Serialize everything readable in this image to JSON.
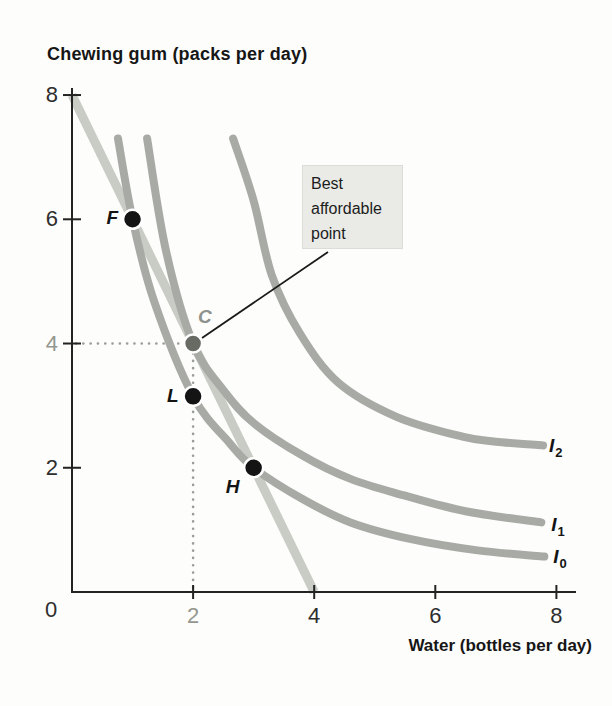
{
  "chart_data": {
    "type": "line",
    "title": "Chewing gum (packs per day)",
    "xlabel": "Water (bottles per day)",
    "x_axis": {
      "range": [
        0,
        8
      ],
      "ticks": [
        {
          "v": 0,
          "label": "0",
          "highlight": false
        },
        {
          "v": 2,
          "label": "2",
          "highlight": true
        },
        {
          "v": 4,
          "label": "4",
          "highlight": false
        },
        {
          "v": 6,
          "label": "6",
          "highlight": false
        },
        {
          "v": 8,
          "label": "8",
          "highlight": false
        }
      ]
    },
    "y_axis": {
      "range": [
        0,
        8
      ],
      "ticks": [
        {
          "v": 2,
          "label": "2",
          "highlight": false
        },
        {
          "v": 4,
          "label": "4",
          "highlight": true
        },
        {
          "v": 6,
          "label": "6",
          "highlight": false
        },
        {
          "v": 8,
          "label": "8",
          "highlight": false
        }
      ]
    },
    "budget_line": {
      "name": "budget-line",
      "points": [
        [
          0,
          8
        ],
        [
          4,
          0
        ]
      ]
    },
    "series": [
      {
        "name": "I0",
        "label": "I",
        "sub": "0",
        "points": [
          [
            0.76,
            7.3
          ],
          [
            1.0,
            6.0
          ],
          [
            1.35,
            4.7
          ],
          [
            2.0,
            3.15
          ],
          [
            2.6,
            2.4
          ],
          [
            3.0,
            2.0
          ],
          [
            3.8,
            1.5
          ],
          [
            4.6,
            1.12
          ],
          [
            5.6,
            0.85
          ],
          [
            6.7,
            0.67
          ],
          [
            7.8,
            0.57
          ]
        ]
      },
      {
        "name": "I1",
        "label": "I",
        "sub": "1",
        "points": [
          [
            1.24,
            7.3
          ],
          [
            1.55,
            5.5
          ],
          [
            2.0,
            4.0
          ],
          [
            2.5,
            3.25
          ],
          [
            3.0,
            2.72
          ],
          [
            3.8,
            2.2
          ],
          [
            4.6,
            1.82
          ],
          [
            5.5,
            1.55
          ],
          [
            6.5,
            1.3
          ],
          [
            7.75,
            1.12
          ]
        ]
      },
      {
        "name": "I2",
        "label": "I",
        "sub": "2",
        "points": [
          [
            2.66,
            7.3
          ],
          [
            3.0,
            6.3
          ],
          [
            3.3,
            5.1
          ],
          [
            3.76,
            4.17
          ],
          [
            4.4,
            3.37
          ],
          [
            5.36,
            2.82
          ],
          [
            6.45,
            2.5
          ],
          [
            7.0,
            2.42
          ],
          [
            7.78,
            2.36
          ]
        ]
      }
    ],
    "points": [
      {
        "id": "F",
        "label": "F",
        "x": 1,
        "y": 6,
        "style": "black"
      },
      {
        "id": "C",
        "label": "C",
        "x": 2,
        "y": 4,
        "style": "gray"
      },
      {
        "id": "L",
        "label": "L",
        "x": 2,
        "y": 3.15,
        "style": "black"
      },
      {
        "id": "H",
        "label": "H",
        "x": 3,
        "y": 2,
        "style": "black"
      }
    ],
    "guides": {
      "x": 2,
      "y": 4
    },
    "annotation": {
      "text": "Best affordable point",
      "target": "C"
    }
  },
  "colors": {
    "curve": "#a8aba5",
    "budget_line": "#c8ccc5",
    "axis": "#232323",
    "dotted_guide": "#9b9e98",
    "point_black": "#141414",
    "point_gray": "#686b64",
    "gray_label": "#8f928c",
    "callout_bg": "#eaebe7",
    "leader_line": "#1a1a1a"
  }
}
